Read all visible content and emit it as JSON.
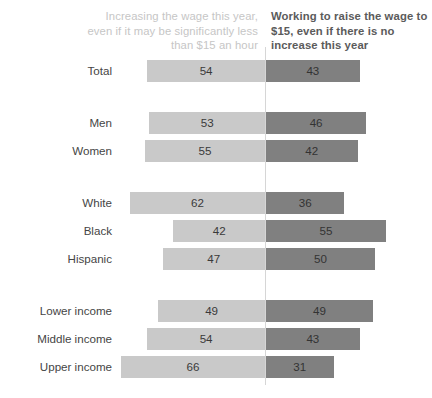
{
  "chart_data": {
    "type": "bar",
    "orientation": "horizontal",
    "layout": "diverging-back-to-back",
    "title": "",
    "subtitle": "",
    "xlabel": "",
    "ylabel": "",
    "grid": false,
    "legend_position": "top",
    "axis_center_value": 0,
    "value_unit": "%",
    "categories": [
      "Total",
      "Men",
      "Women",
      "White",
      "Black",
      "Hispanic",
      "Lower income",
      "Middle income",
      "Upper income"
    ],
    "group_breaks_after": [
      "Total",
      "Women",
      "Hispanic"
    ],
    "series": [
      {
        "name": "Increasing the wage this year, even if it may be significantly less than $15 an hour",
        "side": "left",
        "color": "#c9c9c9",
        "values": [
          54,
          53,
          55,
          62,
          42,
          47,
          49,
          54,
          66
        ]
      },
      {
        "name": "Working to raise the wage to $15, even if there is no increase this year",
        "side": "right",
        "color": "#808080",
        "values": [
          43,
          46,
          42,
          36,
          55,
          50,
          49,
          43,
          31
        ]
      }
    ]
  },
  "headers": {
    "left": "Increasing the wage this year, even if it may be significantly less than $15 an hour",
    "right": "Working to raise the wage to $15, even if there is no increase this year"
  },
  "colors": {
    "background": "#ffffff",
    "bar_left": "#c9c9c9",
    "bar_right": "#808080",
    "divider": "#d6d6d6",
    "header_left_text": "#c6c6c6",
    "header_right_text": "#5b5b5b",
    "label_text": "#454545",
    "value_text": "#3a3a3a"
  }
}
